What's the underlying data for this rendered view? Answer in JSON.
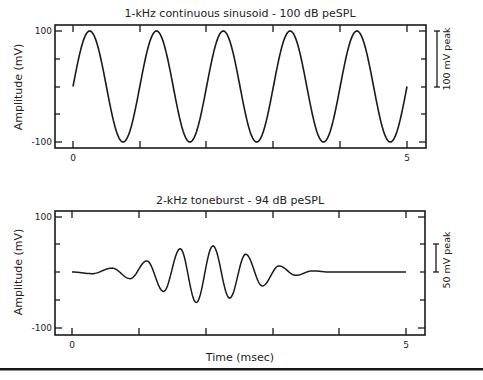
{
  "chart_data": [
    {
      "type": "line",
      "title": "1-kHz continuous sinusoid - 100 dB peSPL",
      "xlabel": "",
      "ylabel": "Amplitude (mV)",
      "xlim": [
        0,
        5
      ],
      "ylim": [
        -100,
        100
      ],
      "x_tick_labels": [
        "0",
        "5"
      ],
      "x_ticks": [
        0,
        1,
        2,
        3,
        4,
        5
      ],
      "y_tick_labels": [
        "100",
        "-100"
      ],
      "y_ticks": [
        100,
        50,
        0,
        -50,
        -100
      ],
      "grid": false,
      "series": [
        {
          "name": "1-kHz continuous sinusoid",
          "function": "100*sin(2*pi*1*t)",
          "frequency_khz": 1,
          "amplitude_mv": 100,
          "x": [
            0,
            0.25,
            0.5,
            0.75,
            1,
            1.25,
            1.5,
            1.75,
            2,
            2.25,
            2.5,
            2.75,
            3,
            3.25,
            3.5,
            3.75,
            4,
            4.25,
            4.5,
            4.75,
            5
          ],
          "values": [
            0,
            100,
            0,
            -100,
            0,
            100,
            0,
            -100,
            0,
            100,
            0,
            -100,
            0,
            100,
            0,
            -100,
            0,
            100,
            0,
            -100,
            0
          ]
        }
      ],
      "annotations": [
        {
          "text": "100 mV peak",
          "type": "scale-bar",
          "from": 0,
          "to": 100
        }
      ]
    },
    {
      "type": "line",
      "title": "2-kHz toneburst - 94 dB peSPL",
      "xlabel": "Time (msec)",
      "ylabel": "Amplitude (mV)",
      "xlim": [
        0,
        5
      ],
      "ylim": [
        -100,
        100
      ],
      "x_tick_labels": [
        "0",
        "5"
      ],
      "x_ticks": [
        0,
        1,
        2,
        3,
        4,
        5
      ],
      "y_tick_labels": [
        "100",
        "-100"
      ],
      "y_ticks": [
        100,
        50,
        0,
        -50,
        -100
      ],
      "grid": false,
      "series": [
        {
          "name": "2-kHz toneburst",
          "x": [
            0,
            0.3,
            0.6,
            0.87,
            1.12,
            1.37,
            1.62,
            1.86,
            2.11,
            2.36,
            2.6,
            2.85,
            3.1,
            3.35,
            3.6,
            3.85,
            4.2,
            5
          ],
          "values": [
            0,
            -3,
            7,
            -12,
            20,
            -35,
            42,
            -55,
            47,
            -47,
            32,
            -25,
            11,
            -6,
            2,
            0,
            0,
            0
          ]
        }
      ],
      "annotations": [
        {
          "text": "50 mV peak",
          "type": "scale-bar",
          "from": 0,
          "to": 50
        }
      ]
    }
  ],
  "top_chart": {
    "title": "1-kHz continuous sinusoid - 100 dB peSPL",
    "ylabel": "Amplitude (mV)",
    "y_top": "100",
    "y_bottom": "-100",
    "x_start": "0",
    "x_end": "5",
    "scale_label": "100 mV peak"
  },
  "bottom_chart": {
    "title": "2-kHz toneburst - 94 dB peSPL",
    "ylabel": "Amplitude (mV)",
    "y_top": "100",
    "y_bottom": "-100",
    "x_start": "0",
    "x_end": "5",
    "scale_label": "50 mV peak",
    "xlabel": "Time (msec)"
  }
}
